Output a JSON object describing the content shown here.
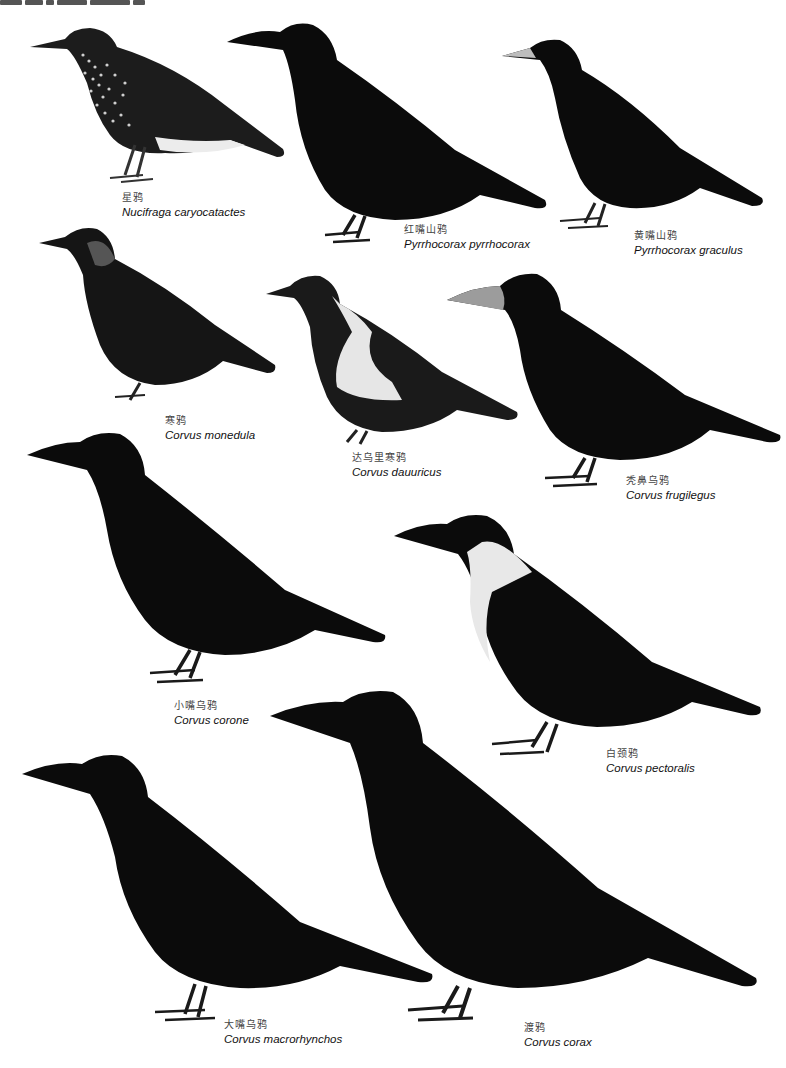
{
  "page": {
    "background": "#ffffff",
    "header_text_visible": "partially cropped plate heading at top-left"
  },
  "species": [
    {
      "id": "nutcracker",
      "cn": "星鸦",
      "sci": "Nucifraga caryocatactes",
      "plumage": "dark brown with white spots, white undertail"
    },
    {
      "id": "red-billed-chough",
      "cn": "红嘴山鸦",
      "sci": "Pyrrhocorax pyrrhocorax",
      "plumage": "glossy black"
    },
    {
      "id": "yellow-billed-chough",
      "cn": "黄嘴山鸦",
      "sci": "Pyrrhocorax graculus",
      "plumage": "glossy black, pale bill"
    },
    {
      "id": "jackdaw",
      "cn": "寒鸦",
      "sci": "Corvus monedula",
      "plumage": "black with grey nape"
    },
    {
      "id": "daurian-jackdaw",
      "cn": "达乌里寒鸦",
      "sci": "Corvus dauuricus",
      "plumage": "black with white collar and belly"
    },
    {
      "id": "rook",
      "cn": "秃鼻乌鸦",
      "sci": "Corvus frugilegus",
      "plumage": "black, bare pale face"
    },
    {
      "id": "carrion-crow",
      "cn": "小嘴乌鸦",
      "sci": "Corvus corone",
      "plumage": "black"
    },
    {
      "id": "collared-crow",
      "cn": "白颈鸦",
      "sci": "Corvus pectoralis",
      "plumage": "black with white collar"
    },
    {
      "id": "large-billed-crow",
      "cn": "大嘴乌鸦",
      "sci": "Corvus macrorhynchos",
      "plumage": "black"
    },
    {
      "id": "raven",
      "cn": "渡鸦",
      "sci": "Corvus corax",
      "plumage": "black"
    }
  ],
  "colors": {
    "black_plumage": "#0b0b0b",
    "dark_grey": "#2a2a2a",
    "white_patch": "#e9e9e9",
    "spot_white": "#d8d8d8",
    "bill_pale": "#bdbdbd"
  }
}
